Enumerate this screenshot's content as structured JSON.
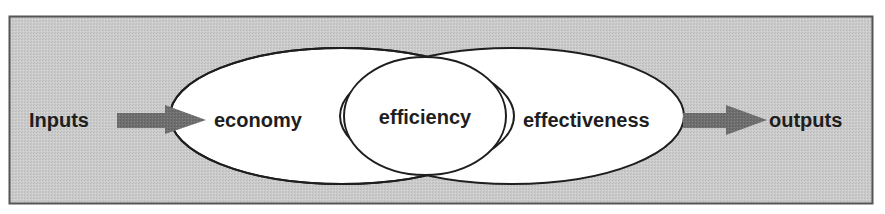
{
  "diagram": {
    "title": "",
    "nodes": {
      "inputs": "Inputs",
      "economy": "economy",
      "efficiency": "efficiency",
      "effectiveness": "effectiveness",
      "outputs": "outputs"
    },
    "edges": [
      {
        "from": "inputs",
        "to": "economy"
      },
      {
        "from": "effectiveness",
        "to": "outputs"
      }
    ],
    "colors": {
      "frame_fill": "#c8c8c8",
      "frame_border": "#555555",
      "ellipse_fill": "#ffffff",
      "ellipse_stroke": "#1e1e1e",
      "arrow_fill": "#6e6e6e",
      "text": "#1e1e1e"
    }
  }
}
